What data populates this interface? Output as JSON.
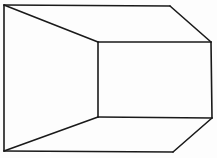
{
  "figure": {
    "type": "line-drawing",
    "colors": {
      "background": "#fdfdfd",
      "stroke": "#1a1a1a"
    },
    "vertices": {
      "outer_top_left": [
        4,
        5
      ],
      "outer_top_right": [
        170,
        6
      ],
      "outer_bottom_left": [
        4,
        151
      ],
      "outer_bottom_right": [
        173,
        152
      ],
      "inner_top_left": [
        98,
        42
      ],
      "inner_top_right": [
        211,
        42
      ],
      "inner_bottom_left": [
        98,
        117
      ],
      "inner_bottom_right": [
        212,
        118
      ]
    },
    "edges": [
      [
        "outer_top_left",
        "outer_top_right"
      ],
      [
        "outer_top_right",
        "inner_top_right"
      ],
      [
        "outer_top_left",
        "outer_bottom_left"
      ],
      [
        "outer_bottom_left",
        "outer_bottom_right"
      ],
      [
        "outer_bottom_right",
        "inner_bottom_right"
      ],
      [
        "outer_top_left",
        "inner_top_left"
      ],
      [
        "outer_bottom_left",
        "inner_bottom_left"
      ],
      [
        "inner_top_left",
        "inner_top_right"
      ],
      [
        "inner_top_right",
        "inner_bottom_right"
      ],
      [
        "inner_bottom_right",
        "inner_bottom_left"
      ],
      [
        "inner_bottom_left",
        "inner_top_left"
      ]
    ]
  }
}
